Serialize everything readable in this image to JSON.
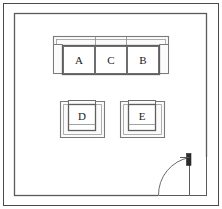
{
  "drawing": {
    "type": "floor-plan",
    "title": "Living room seating layout floor plan",
    "canvas": {
      "width": 222,
      "height": 209
    },
    "colors": {
      "background": "#ffffff",
      "frame_line": "#4a4a4a",
      "wall_line": "#5a5a5a",
      "furniture_outline": "#6e6e6e",
      "furniture_inner": "#8a8a8a",
      "furniture_fill": "#fbfbfb",
      "label_text": "#1a1a1a",
      "door_line": "#5a5a5a",
      "hinge_fill": "#2b2b2b"
    }
  },
  "frame": {
    "name": "outer-border",
    "x": 3,
    "y": 3,
    "width": 216,
    "height": 203,
    "stroke_width": 1
  },
  "room": {
    "name": "room-wall",
    "x": 14,
    "y": 13,
    "width": 193,
    "height": 183,
    "stroke_width": 1.2,
    "label": "Room"
  },
  "furniture": [
    {
      "id": "sofa",
      "name": "three-seat-sofa",
      "kind": "sofa",
      "seats": 3,
      "outer": {
        "x": 53,
        "y": 36,
        "width": 116,
        "height": 38
      },
      "cushions": [
        {
          "label": "A",
          "x": 66,
          "y": 46,
          "width": 30,
          "height": 28
        },
        {
          "label": "C",
          "x": 96,
          "y": 46,
          "width": 30,
          "height": 28
        },
        {
          "label": "B",
          "x": 126,
          "y": 46,
          "width": 30,
          "height": 28
        }
      ],
      "label_y": 62
    },
    {
      "id": "armchair-d",
      "name": "armchair",
      "kind": "armchair",
      "seats": 1,
      "outer": {
        "x": 60,
        "y": 100,
        "width": 44,
        "height": 38
      },
      "cushions": [
        {
          "label": "D",
          "x": 69,
          "y": 104,
          "width": 26,
          "height": 28
        }
      ],
      "label_y": 118
    },
    {
      "id": "armchair-e",
      "name": "armchair",
      "kind": "armchair",
      "seats": 1,
      "outer": {
        "x": 120,
        "y": 100,
        "width": 44,
        "height": 38
      },
      "cushions": [
        {
          "label": "E",
          "x": 129,
          "y": 104,
          "width": 26,
          "height": 28
        }
      ],
      "label_y": 118
    }
  ],
  "door": {
    "name": "swing-door",
    "hinge": {
      "x": 190,
      "y": 157
    },
    "opening_start": {
      "x": 158,
      "y": 196
    },
    "arc_radius": 39,
    "leaf": {
      "x": 187,
      "y": 155,
      "width": 5,
      "height": 14
    },
    "panel": {
      "x": 190,
      "y": 157,
      "width": 17,
      "height": 39
    }
  },
  "labels": {
    "seat_a": "A",
    "seat_c": "C",
    "seat_b": "B",
    "seat_d": "D",
    "seat_e": "E"
  }
}
